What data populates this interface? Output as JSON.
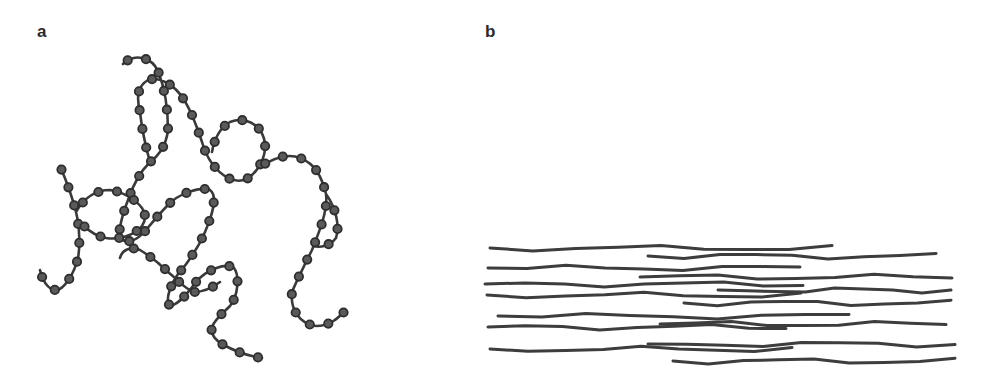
{
  "figure": {
    "panels": [
      {
        "id": "a",
        "label": "a",
        "description": "Random coil polymer chain with monomer beads (amorphous, entangled)"
      },
      {
        "id": "b",
        "label": "b",
        "description": "Aligned, oriented polymer chains (extended, parallel)"
      }
    ],
    "colors": {
      "chain": "#3a3a3a",
      "bead_fill": "#5a5a5a",
      "background": "#ffffff"
    }
  }
}
